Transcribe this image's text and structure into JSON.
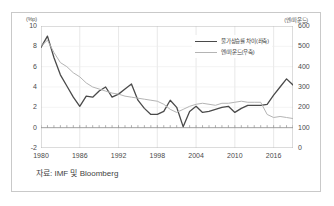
{
  "figure": {
    "source_note": "자료: IMF 및 Bloomberg",
    "left_axis_unit": "(%p)",
    "right_axis_unit": "(엔/파운드)"
  },
  "legend": {
    "position": "top-right",
    "entries": [
      {
        "label": "물가상승률 차이(좌축)",
        "color": "#4a4a4a",
        "axis": "left"
      },
      {
        "label": "엔/파운드(우축)",
        "color": "#b4b4b4",
        "axis": "right"
      }
    ]
  },
  "axes": {
    "y_left_ticks": [
      "10",
      "8",
      "6",
      "4",
      "2",
      "0",
      "-2"
    ],
    "y_right_ticks": [
      "600",
      "500",
      "400",
      "300",
      "200",
      "100",
      "0"
    ],
    "x_ticks": [
      "1980",
      "1986",
      "1992",
      "1998",
      "2004",
      "2010",
      "2016"
    ]
  },
  "chart_data": {
    "type": "line",
    "title": "",
    "xlabel": "",
    "ylabel": "(%p)",
    "y2label": "(엔/파운드)",
    "xlim": [
      1980,
      2019
    ],
    "ylim": [
      -2,
      10
    ],
    "y2lim": [
      0,
      600
    ],
    "grid": true,
    "legend_position": "top-right",
    "x": [
      1980,
      1981,
      1982,
      1983,
      1984,
      1985,
      1986,
      1987,
      1988,
      1989,
      1990,
      1991,
      1992,
      1993,
      1994,
      1995,
      1996,
      1997,
      1998,
      1999,
      2000,
      2001,
      2002,
      2003,
      2004,
      2005,
      2006,
      2007,
      2008,
      2009,
      2010,
      2011,
      2012,
      2013,
      2014,
      2015,
      2016,
      2017,
      2018,
      2019
    ],
    "series": [
      {
        "name": "물가상승률 차이(좌축)",
        "axis": "left",
        "unit": "%p",
        "color": "#4a4a4a",
        "values": [
          7.9,
          9.0,
          6.9,
          5.2,
          4.1,
          3.0,
          2.1,
          3.1,
          3.0,
          3.6,
          4.0,
          3.0,
          3.3,
          3.8,
          4.3,
          2.7,
          1.9,
          1.3,
          1.3,
          1.6,
          2.7,
          2.0,
          0.1,
          1.6,
          2.1,
          1.5,
          1.6,
          1.8,
          2.0,
          2.1,
          1.5,
          1.9,
          2.2,
          2.2,
          2.2,
          2.3,
          3.2,
          4.0,
          4.8,
          4.2
        ]
      },
      {
        "name": "엔/파운드(우축)",
        "axis": "right",
        "unit": "엔/파운드",
        "color": "#b4b4b4",
        "values": [
          500,
          530,
          470,
          420,
          400,
          370,
          350,
          320,
          300,
          290,
          280,
          270,
          265,
          255,
          250,
          245,
          240,
          235,
          230,
          215,
          190,
          175,
          190,
          205,
          215,
          220,
          215,
          210,
          220,
          220,
          225,
          230,
          225,
          225,
          225,
          165,
          150,
          155,
          150,
          145
        ]
      }
    ],
    "notes": [
      "Dark line (left axis, %p) runs from about 9 in 1981 down to a trough near 2.1 in 1986, oscillates 3-4 through the early 1990s, falls to about 1.3 by 1998, dips to roughly 0.0 in 2002, stays near 1.5-2.3 through the 2000s, peaks near 4.8 in 2011, plunges to about -1.3 in 2015, then recovers to roughly 2.2 by 2018-2019.",
      "Light grey line (right axis, yen/pound) starts near 500 in 1980, declines steadily to about 230 by 1998, dips near 175 in 2001, recovers to roughly 225 by 2007-2008, falls to about 130 in 2011-2012, rises to near 190 in 2015-2016, then eases to about 150."
    ]
  }
}
